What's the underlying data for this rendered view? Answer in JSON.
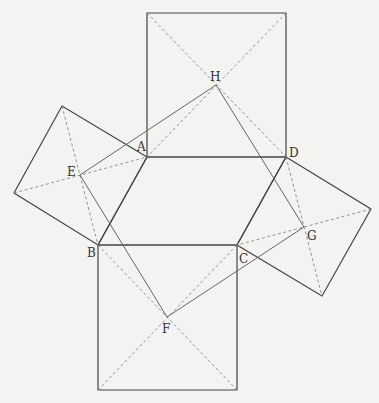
{
  "diagram": {
    "points": {
      "A": [
        147,
        157
      ],
      "B": [
        98,
        245
      ],
      "C": [
        237,
        245
      ],
      "D": [
        286,
        157
      ],
      "E": [
        80,
        175
      ],
      "F": [
        167,
        317
      ],
      "G": [
        304,
        227
      ],
      "H": [
        216,
        85
      ]
    },
    "labels": [
      {
        "id": "A",
        "text": "A",
        "x": 137,
        "y": 151
      },
      {
        "id": "B",
        "text": "B",
        "x": 87,
        "y": 257
      },
      {
        "id": "C",
        "text": "C",
        "x": 239,
        "y": 263
      },
      {
        "id": "D",
        "text": "D",
        "x": 289,
        "y": 157
      },
      {
        "id": "E",
        "text": "E",
        "x": 67,
        "y": 176
      },
      {
        "id": "F",
        "text": "F",
        "x": 162,
        "y": 333
      },
      {
        "id": "G",
        "text": "G",
        "x": 307,
        "y": 240
      },
      {
        "id": "H",
        "text": "H",
        "x": 210,
        "y": 81
      }
    ],
    "squares": [
      {
        "name": "top-square",
        "corners": [
          [
            147,
            157
          ],
          [
            147,
            13
          ],
          [
            286,
            13
          ],
          [
            286,
            157
          ]
        ]
      },
      {
        "name": "left-square",
        "corners": [
          [
            147,
            157
          ],
          [
            62,
            106
          ],
          [
            14,
            193
          ],
          [
            98,
            245
          ]
        ]
      },
      {
        "name": "bottom-square",
        "corners": [
          [
            98,
            245
          ],
          [
            237,
            245
          ],
          [
            237,
            390
          ],
          [
            98,
            390
          ]
        ]
      },
      {
        "name": "right-square",
        "corners": [
          [
            286,
            157
          ],
          [
            371,
            209
          ],
          [
            322,
            296
          ],
          [
            237,
            245
          ]
        ]
      }
    ],
    "colors": {
      "solid": "#444444",
      "connector": "#666666",
      "dashed": "#888888",
      "background": "#f3f3f1"
    }
  }
}
